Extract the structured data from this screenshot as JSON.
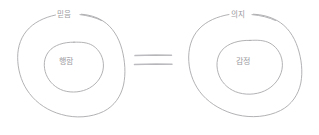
{
  "figure": {
    "kind": "hand-drawn-diagram",
    "background_color": "#ffffff",
    "stroke_color": "#a9a9ad",
    "text_color": "#9a9aa0",
    "equation_symbol": "="
  },
  "left_group": {
    "outer_label": "믿음",
    "inner_label": "행함"
  },
  "relation": {
    "symbol": "="
  },
  "right_group": {
    "outer_label": "의지",
    "inner_label": "감정"
  }
}
